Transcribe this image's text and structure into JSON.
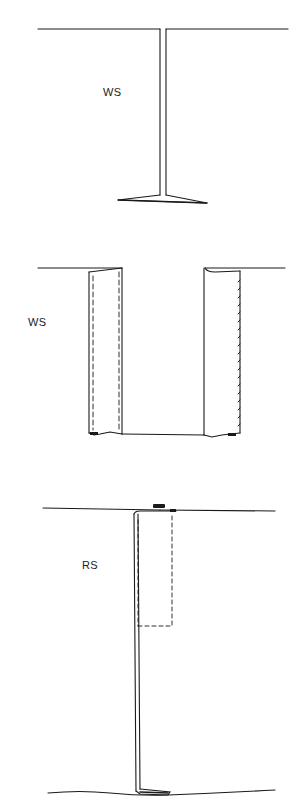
{
  "diagram": {
    "type": "seam-construction-illustrations",
    "panels": [
      {
        "id": "panel-1",
        "label": "WS",
        "description": "Plain seam with allowances pressed open, fabric wrong side shown"
      },
      {
        "id": "panel-2",
        "label": "WS",
        "description": "Opened seam allowances with stitching lines (dashed) and pinked/overcast edge on right"
      },
      {
        "id": "panel-3",
        "label": "RS",
        "description": "Folded seam with dashed stitching rectangle near top, right side shown"
      }
    ],
    "colors": {
      "line": "#1a1a1a",
      "background": "#ffffff",
      "text": "#222222"
    }
  }
}
